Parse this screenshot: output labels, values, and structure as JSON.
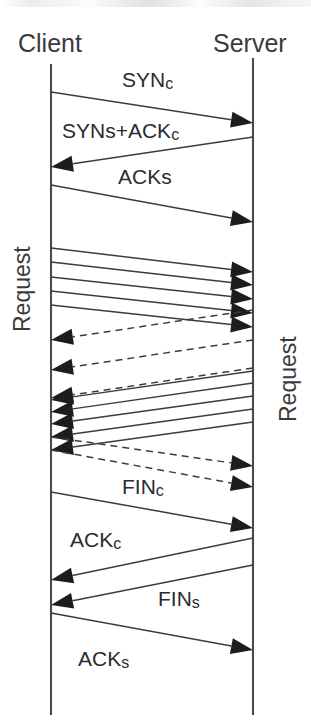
{
  "diagram": {
    "type": "tcp-sequence-diagram",
    "title_visible": false,
    "colors": {
      "ink": "#231f20",
      "line": "#3c3c3e",
      "lifeline": "#4a4a4c",
      "arrowhead": "#1d1d1f",
      "background": "#ffffff"
    },
    "participants": [
      {
        "id": "client",
        "label": "Client",
        "x": 51,
        "label_x": 18,
        "label_y": 52
      },
      {
        "id": "server",
        "label": "Server",
        "x": 253,
        "label_x": 213,
        "label_y": 52
      }
    ],
    "lifelines": [
      {
        "participant": "client",
        "x": 51,
        "y_top": 64,
        "y_bottom": 715
      },
      {
        "participant": "server",
        "x": 253,
        "y_top": 58,
        "y_bottom": 715
      }
    ],
    "side_labels": [
      {
        "id": "request-client",
        "text": "Request",
        "x": 22,
        "y_start": 210,
        "y_end": 332,
        "rotation": -90,
        "side": "left"
      },
      {
        "id": "request-server",
        "text": "Request",
        "x": 288,
        "y_start": 300,
        "y_end": 422,
        "rotation": -90,
        "side": "right"
      }
    ],
    "messages": [
      {
        "id": "sync",
        "label": "SYNc",
        "sub": "",
        "label_main": "SYN",
        "label_sub": "c",
        "direction": "right",
        "style": "solid",
        "y_from": 92,
        "y_to": 123,
        "label_x": 122,
        "label_y": 87
      },
      {
        "id": "syns-ackc",
        "label": "SYNs+ACKc",
        "sub": "",
        "label_main": "SYNs+ACK",
        "label_sub": "c",
        "direction": "left",
        "style": "solid",
        "y_from": 137,
        "y_to": 167,
        "label_x": 62,
        "label_y": 138
      },
      {
        "id": "acks",
        "label": "ACKs",
        "sub": "",
        "label_main": "ACKs",
        "label_sub": "",
        "direction": "right",
        "style": "solid",
        "y_from": 185,
        "y_to": 222,
        "label_x": 118,
        "label_y": 184
      },
      {
        "id": "req-1",
        "label": "",
        "sub": "",
        "direction": "right",
        "style": "solid",
        "y_from": 248,
        "y_to": 272
      },
      {
        "id": "req-2",
        "label": "",
        "sub": "",
        "direction": "right",
        "style": "solid",
        "y_from": 262,
        "y_to": 285
      },
      {
        "id": "req-3",
        "label": "",
        "sub": "",
        "direction": "right",
        "style": "solid",
        "y_from": 277,
        "y_to": 299
      },
      {
        "id": "req-4",
        "label": "",
        "sub": "",
        "direction": "right",
        "style": "solid",
        "y_from": 291,
        "y_to": 313
      },
      {
        "id": "req-5",
        "label": "",
        "sub": "",
        "direction": "right",
        "style": "solid",
        "y_from": 305,
        "y_to": 327
      },
      {
        "id": "ack-back-1",
        "label": "",
        "sub": "",
        "direction": "left",
        "style": "dashed",
        "y_from": 310,
        "y_to": 340
      },
      {
        "id": "ack-back-2",
        "label": "",
        "sub": "",
        "direction": "left",
        "style": "dashed",
        "y_from": 340,
        "y_to": 370
      },
      {
        "id": "ack-back-3",
        "label": "",
        "sub": "",
        "direction": "left",
        "style": "dashed",
        "y_from": 368,
        "y_to": 398
      },
      {
        "id": "resp-1",
        "label": "",
        "sub": "",
        "direction": "left",
        "style": "solid",
        "y_from": 371,
        "y_to": 400
      },
      {
        "id": "resp-2",
        "label": "",
        "sub": "",
        "direction": "left",
        "style": "solid",
        "y_from": 383,
        "y_to": 412
      },
      {
        "id": "resp-3",
        "label": "",
        "sub": "",
        "direction": "left",
        "style": "solid",
        "y_from": 396,
        "y_to": 424
      },
      {
        "id": "resp-4",
        "label": "",
        "sub": "",
        "direction": "left",
        "style": "solid",
        "y_from": 409,
        "y_to": 437
      },
      {
        "id": "resp-5",
        "label": "",
        "sub": "",
        "direction": "left",
        "style": "solid",
        "y_from": 422,
        "y_to": 450
      },
      {
        "id": "ack-fwd-1",
        "label": "",
        "sub": "",
        "direction": "right",
        "style": "dashed",
        "y_from": 437,
        "y_to": 466
      },
      {
        "id": "ack-fwd-2",
        "label": "",
        "sub": "",
        "direction": "right",
        "style": "dashed",
        "y_from": 450,
        "y_to": 487
      },
      {
        "id": "finc",
        "label": "FINc",
        "sub": "",
        "label_main": "FIN",
        "label_sub": "c",
        "direction": "right",
        "style": "solid",
        "y_from": 492,
        "y_to": 528,
        "label_x": 122,
        "label_y": 494
      },
      {
        "id": "ackc",
        "label": "ACKc",
        "sub": "",
        "label_main": "ACK",
        "label_sub": "c",
        "direction": "left",
        "style": "solid",
        "y_from": 538,
        "y_to": 580,
        "label_x": 70,
        "label_y": 547
      },
      {
        "id": "fins",
        "label": "FINs",
        "sub": "",
        "label_main": "FIN",
        "label_sub": "s",
        "direction": "left",
        "style": "solid",
        "y_from": 565,
        "y_to": 605,
        "label_x": 158,
        "label_y": 606
      },
      {
        "id": "acks-final",
        "label": "ACKs",
        "sub": "",
        "label_main": "ACK",
        "label_sub": "s",
        "direction": "right",
        "style": "solid",
        "y_from": 613,
        "y_to": 650,
        "label_x": 78,
        "label_y": 666
      }
    ],
    "annotations": {
      "arrowhead_length": 22,
      "arrowhead_halfwidth": 8,
      "notes": "TCP connection lifecycle: three-way handshake, pipelined HTTP requests with responses and acknowledgements, then four-way teardown."
    }
  }
}
